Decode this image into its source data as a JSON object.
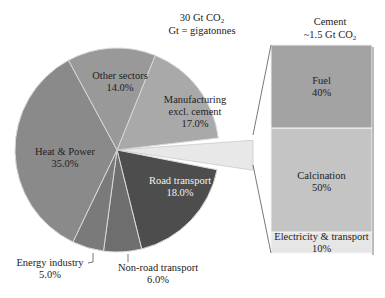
{
  "chart_data": {
    "type": "pie",
    "title": "30 Gt CO2",
    "subtitle": "Gt = gigatonnes",
    "slices": [
      {
        "label": "Manufacturing excl. cement",
        "value": 17.0,
        "pct_label": "17.0%",
        "color": "#a9a9a9"
      },
      {
        "label": "Cement",
        "value": 5.0,
        "pct_label": "",
        "color": "#e8e8e8",
        "exploded": true
      },
      {
        "label": "Road transport",
        "value": 18.0,
        "pct_label": "18.0%",
        "color": "#4d4d4d"
      },
      {
        "label": "Non-road transport",
        "value": 6.0,
        "pct_label": "6.0%",
        "color": "#6e6e6e"
      },
      {
        "label": "Energy industry",
        "value": 5.0,
        "pct_label": "5.0%",
        "color": "#7a7a7a"
      },
      {
        "label": "Heat & Power",
        "value": 35.0,
        "pct_label": "35.0%",
        "color": "#8a8a8a"
      },
      {
        "label": "Other sectors",
        "value": 14.0,
        "pct_label": "14.0%",
        "color": "#999999"
      }
    ],
    "breakdown": {
      "title": "Cement",
      "subtitle": "~1.5 Gt CO2",
      "type": "stacked-bar",
      "segments": [
        {
          "label": "Fuel",
          "value": 40,
          "pct_label": "40%",
          "color": "#a3a3a3"
        },
        {
          "label": "Calcination",
          "value": 50,
          "pct_label": "50%",
          "color": "#c4c4c4"
        },
        {
          "label": "Electricity & transport",
          "value": 10,
          "pct_label": "10%",
          "color": "#e6e6e6"
        }
      ]
    }
  },
  "labels": {
    "title_line1": "30 Gt CO",
    "title_sub": "2",
    "title_line2": "Gt = gigatonnes",
    "other": "Other sectors",
    "other_pct": "14.0%",
    "manuf_1": "Manufacturing",
    "manuf_2": "excl. cement",
    "manuf_pct": "17.0%",
    "heat": "Heat & Power",
    "heat_pct": "35.0%",
    "road": "Road transport",
    "road_pct": "18.0%",
    "energy": "Energy industry",
    "energy_pct": "5.0%",
    "nonroad": "Non-road transport",
    "nonroad_pct": "6.0%",
    "cement_title": "Cement",
    "cement_sub_1": "~1.5 Gt CO",
    "cement_sub_2": "2",
    "fuel": "Fuel",
    "fuel_pct": "40%",
    "calc": "Calcination",
    "calc_pct": "50%",
    "elec": "Electricity & transport",
    "elec_pct": "10%"
  }
}
